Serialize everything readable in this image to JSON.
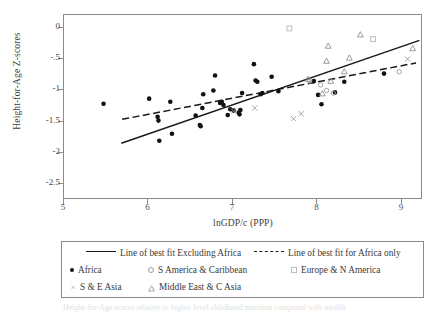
{
  "chart_data": {
    "type": "scatter",
    "title": "",
    "xlabel": "lnGDP/c (PPP)",
    "ylabel": "Height-for-Age Z-scores",
    "xlim": [
      5,
      9.25
    ],
    "ylim": [
      -2.75,
      0.2
    ],
    "xticks": [
      5,
      6,
      7,
      8,
      9
    ],
    "xticklabels": [
      "5",
      "6",
      "7",
      "8",
      "9"
    ],
    "yticks": [
      0,
      -0.5,
      -1,
      -1.5,
      -2,
      -2.5
    ],
    "yticklabels": [
      "0",
      "-.5",
      "-1",
      "-1.5",
      "-2",
      "-2.5"
    ],
    "grid": false,
    "legend_position": "below-plot",
    "series": [
      {
        "name": "Africa",
        "marker": "filled-circle",
        "color": "#111111",
        "points": [
          [
            5.48,
            -1.23
          ],
          [
            6.02,
            -1.15
          ],
          [
            6.12,
            -1.44
          ],
          [
            6.13,
            -1.5
          ],
          [
            6.14,
            -1.82
          ],
          [
            6.27,
            -1.2
          ],
          [
            6.29,
            -1.71
          ],
          [
            6.57,
            -1.42
          ],
          [
            6.62,
            -1.57
          ],
          [
            6.63,
            -1.59
          ],
          [
            6.65,
            -1.3
          ],
          [
            6.66,
            -1.08
          ],
          [
            6.78,
            -1.02
          ],
          [
            6.8,
            -0.78
          ],
          [
            6.86,
            -1.22
          ],
          [
            6.88,
            -1.2
          ],
          [
            6.9,
            -1.25
          ],
          [
            6.95,
            -1.41
          ],
          [
            6.98,
            -1.32
          ],
          [
            7.02,
            -1.34
          ],
          [
            7.08,
            -1.37
          ],
          [
            7.09,
            -1.4
          ],
          [
            7.1,
            -1.33
          ],
          [
            7.12,
            -1.06
          ],
          [
            7.26,
            -0.6
          ],
          [
            7.28,
            -0.86
          ],
          [
            7.3,
            -0.88
          ],
          [
            7.34,
            -1.08
          ],
          [
            7.36,
            -1.06
          ],
          [
            7.47,
            -0.8
          ],
          [
            7.55,
            -1.03
          ],
          [
            7.97,
            -0.87
          ],
          [
            8.02,
            -1.09
          ],
          [
            8.06,
            -1.24
          ],
          [
            8.22,
            -1.05
          ],
          [
            8.33,
            -0.88
          ],
          [
            8.8,
            -0.75
          ]
        ]
      },
      {
        "name": "S America & Caribbean",
        "marker": "open-circle",
        "color": "#9a9a9a",
        "points": [
          [
            7.92,
            -0.87
          ],
          [
            8.05,
            -0.93
          ],
          [
            8.12,
            -1.02
          ],
          [
            8.2,
            -1.06
          ],
          [
            8.98,
            -0.72
          ]
        ]
      },
      {
        "name": "Europe & N America",
        "marker": "open-square",
        "color": "#bdbdbd",
        "points": [
          [
            7.68,
            -0.03
          ],
          [
            8.67,
            -0.2
          ]
        ]
      },
      {
        "name": "S & E Asia",
        "marker": "cross",
        "color": "#9a9a9a",
        "points": [
          [
            7.02,
            -1.35
          ],
          [
            7.27,
            -1.3
          ],
          [
            7.73,
            -1.47
          ],
          [
            7.82,
            -1.39
          ],
          [
            9.08,
            -0.52
          ]
        ]
      },
      {
        "name": "Middle East & C Asia",
        "marker": "open-triangle",
        "color": "#8f8f8f",
        "points": [
          [
            7.9,
            -0.84
          ],
          [
            8.07,
            -1.07
          ],
          [
            8.12,
            -0.55
          ],
          [
            8.14,
            -0.31
          ],
          [
            8.17,
            -0.87
          ],
          [
            8.33,
            -0.72
          ],
          [
            8.39,
            -0.5
          ],
          [
            8.52,
            -0.13
          ],
          [
            9.14,
            -0.35
          ]
        ]
      }
    ],
    "fit_lines": [
      {
        "name": "Line of best fit Excluding Africa",
        "style": "solid",
        "color": "#1a1a1a",
        "x0": 5.69,
        "y0": -1.86,
        "x1": 9.22,
        "y1": -0.22
      },
      {
        "name": "Line of best fit for Africa only",
        "style": "dashed",
        "color": "#1a1a1a",
        "x0": 5.7,
        "y0": -1.48,
        "x1": 9.18,
        "y1": -0.58
      }
    ]
  },
  "legend": {
    "rows": [
      [
        {
          "key": "solid-line-swatch",
          "label": "Line of best fit Excluding Africa",
          "x": 24
        },
        {
          "key": "dashed-line-swatch",
          "label": "Line of best fit for Africa only",
          "x": 192
        }
      ],
      [
        {
          "key": "filled-circle-swatch",
          "label": "Africa",
          "x": 8
        },
        {
          "key": "open-circle-swatch",
          "label": "S America & Caribbean",
          "x": 86
        },
        {
          "key": "open-square-swatch",
          "label": "Europe & N America",
          "x": 229
        }
      ],
      [
        {
          "key": "cross-swatch",
          "label": "S & E Asia",
          "x": 8
        },
        {
          "key": "open-triangle-swatch",
          "label": "Middle East & C Asia",
          "x": 86
        }
      ]
    ]
  },
  "caption": {
    "text": "Height-for-Age scores relative to higher level childhood nutrition compared with wealth"
  }
}
